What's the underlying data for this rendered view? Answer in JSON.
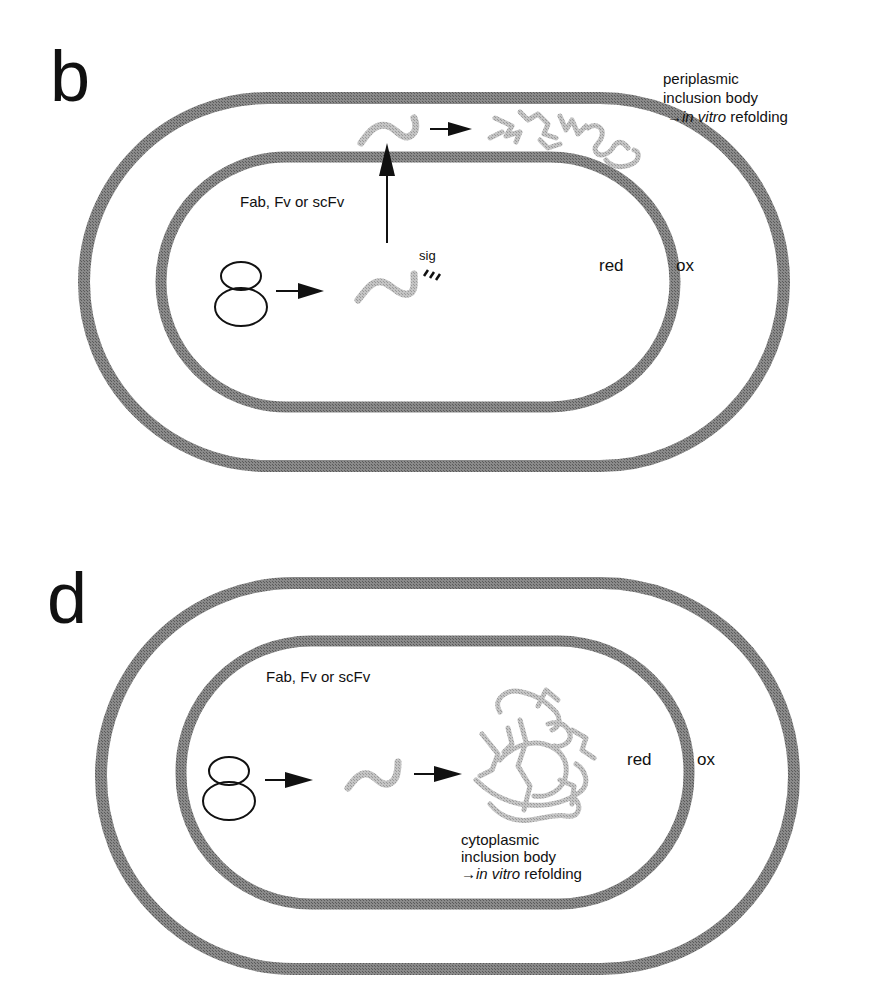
{
  "panels": {
    "b": {
      "letter": "b",
      "protein_label": "Fab, Fv or scFv",
      "signal_label": "sig",
      "compartment_inner": "red",
      "compartment_outer": "ox",
      "result_line1": "periplasmic",
      "result_line2": "inclusion body",
      "result_arrow": "→",
      "result_italic": "in vitro",
      "result_tail": " refolding"
    },
    "d": {
      "letter": "d",
      "protein_label": "Fab, Fv or scFv",
      "compartment_inner": "red",
      "compartment_outer": "ox",
      "result_line1": "cytoplasmic",
      "result_line2": "inclusion body",
      "result_arrow": "→",
      "result_italic": "in vitro",
      "result_tail": " refolding"
    }
  },
  "colors": {
    "membrane": "#7a7a7a",
    "protein": "#b8b8b8",
    "ink": "#111111"
  }
}
